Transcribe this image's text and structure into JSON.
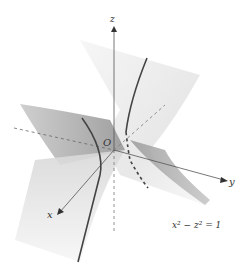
{
  "diagram": {
    "equation": "x² − z² = 1",
    "axes": {
      "x_label": "x",
      "y_label": "y",
      "z_label": "z",
      "origin_label": "O"
    },
    "colors": {
      "background": "#ffffff",
      "surface_light": "#eeeeee",
      "surface_dark": "#a8a8a8",
      "curve": "#444444",
      "axis": "#555555"
    }
  }
}
